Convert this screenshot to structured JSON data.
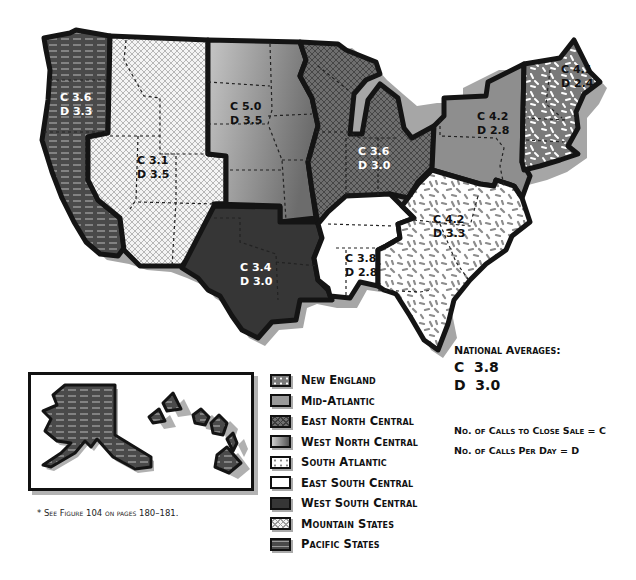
{
  "map": {
    "regions": [
      {
        "id": "pacific",
        "name": "Pacific States",
        "c": "C 3.6",
        "d": "D 3.3",
        "fill": "#4a4a4a",
        "pattern": "dashes-light"
      },
      {
        "id": "mountain",
        "name": "Mountain States",
        "c": "C 3.1",
        "d": "D 3.5",
        "fill": "#f2f2f2",
        "pattern": "crosshatch"
      },
      {
        "id": "west_north_central",
        "name": "West North Central",
        "c": "C 5.0",
        "d": "D 3.5",
        "fill": "#a8a8a8",
        "pattern": "gradient"
      },
      {
        "id": "west_south_central",
        "name": "West South Central",
        "c": "C 3.4",
        "d": "D 3.0",
        "fill": "#3a3a3a",
        "pattern": "solid"
      },
      {
        "id": "east_north_central",
        "name": "East North Central",
        "c": "C 3.6",
        "d": "D 3.0",
        "fill": "#6a6a6a",
        "pattern": "crosshatch-dark"
      },
      {
        "id": "east_south_central",
        "name": "East South Central",
        "c": "C 3.8",
        "d": "D 2.8",
        "fill": "#ffffff",
        "pattern": "solid"
      },
      {
        "id": "south_atlantic",
        "name": "South Atlantic",
        "c": "C 4.2",
        "d": "D 3.3",
        "fill": "#ffffff",
        "pattern": "speckle-gray"
      },
      {
        "id": "mid_atlantic",
        "name": "Mid-Atlantic",
        "c": "C 4.2",
        "d": "D 2.8",
        "fill": "#8e8e8e",
        "pattern": "solid"
      },
      {
        "id": "new_england",
        "name": "New England",
        "c": "C 4.1",
        "d": "D 2.4",
        "fill": "#7a7a7a",
        "pattern": "speckle-white"
      }
    ]
  },
  "legend": {
    "items": [
      {
        "label": "New England",
        "swatch": "speckle-white"
      },
      {
        "label": "Mid-Atlantic",
        "swatch": "solid-mid"
      },
      {
        "label": "East North Central",
        "swatch": "crosshatch-dark"
      },
      {
        "label": "West North Central",
        "swatch": "gradient"
      },
      {
        "label": "South Atlantic",
        "swatch": "speckle-gray"
      },
      {
        "label": "East South Central",
        "swatch": "white"
      },
      {
        "label": "West South Central",
        "swatch": "dark"
      },
      {
        "label": "Mountain States",
        "swatch": "crosshatch"
      },
      {
        "label": "Pacific States",
        "swatch": "dashes-light"
      }
    ]
  },
  "national_averages": {
    "title": "National Averages:",
    "c": "C  3.8",
    "d": "D  3.0"
  },
  "key": {
    "c_definition": "No. of Calls to Close Sale = C",
    "d_definition": "No. of Calls Per Day = D"
  },
  "footnote": "* See Figure 104 on pages 180–181.",
  "inset": {
    "label": "Alaska and Hawaii (Pacific States)"
  }
}
